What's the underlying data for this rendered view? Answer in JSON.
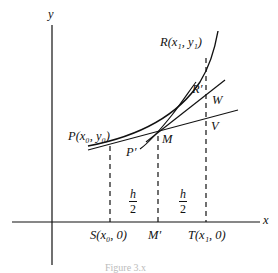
{
  "diagram": {
    "axes": {
      "x_label": "x",
      "y_label": "y"
    },
    "points": {
      "R": "R(x₁, y₁)",
      "P": "P(x₀, y₀)",
      "M": "M",
      "P_prime": "P′",
      "R_prime": "R′",
      "W": "W",
      "V": "V",
      "S": "S(x₀, 0)",
      "M_prime": "M′",
      "T": "T(x₁, 0)"
    },
    "intervals": [
      {
        "numerator": "h",
        "denominator": "2"
      },
      {
        "numerator": "h",
        "denominator": "2"
      }
    ],
    "caption": "Figure 3.x"
  }
}
